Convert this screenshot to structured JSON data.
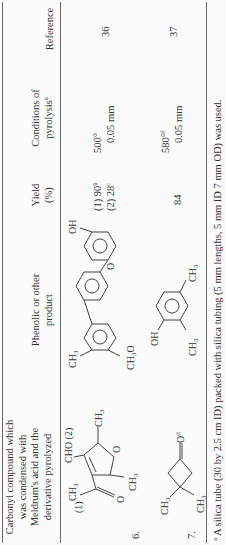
{
  "table": {
    "headers": {
      "carbonyl": [
        "Carbonyl compound which",
        "was condensed with",
        "Meldrum's acid and the",
        "derivative pyrolyzed"
      ],
      "product": [
        "Phenolic or other",
        "product"
      ],
      "yield": [
        "Yield",
        "(%)"
      ],
      "conditions": [
        "Conditions of",
        "pyrolysis"
      ],
      "conditions_note": "a",
      "reference": "Reference"
    },
    "rows": [
      {
        "number": "6.",
        "carbonyl_labels": {
          "pos1": "(1)",
          "pos2": "CHO (2)",
          "ch3_top": "CH",
          "ch3_ring_a": "CH",
          "ch3_ring_b": "CH",
          "o": "O",
          "ring_o": "O",
          "sub3": "3"
        },
        "product_labels": {
          "ch3": "CH",
          "och3": "CH",
          "och3_o": "O",
          "ring_o": "O",
          "oh": "OH",
          "sub3": "3"
        },
        "yield": [
          {
            "text": "(1) 90",
            "note": "b"
          },
          {
            "text": "(2) 28",
            "note": "c"
          }
        ],
        "temperature": "500°",
        "pressure": "0.05 mm",
        "reference": "36"
      },
      {
        "number": "7.",
        "carbonyl_labels": {
          "ch3_a": "CH",
          "ch3_b": "CH",
          "o": "O",
          "o_note": "d",
          "sub3": "3"
        },
        "product_labels": {
          "oh": "OH",
          "ch3_a": "CH",
          "ch3_b": "CH",
          "sub3": "3"
        },
        "yield": [
          {
            "text": "84",
            "note": ""
          }
        ],
        "temperature": "580°",
        "temperature_note": "f",
        "pressure": "0.05 mm",
        "reference": "37"
      }
    ],
    "footnote": {
      "marker": "a",
      "text": "A silica tube (30 by 2.5 cm ID) packed with silica tubing (5 mm lengths, 5 mm ID 7 mm OD) was used."
    }
  }
}
